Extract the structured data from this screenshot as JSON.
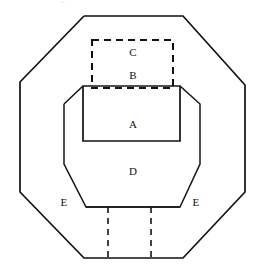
{
  "figure": {
    "background_color": "#ffffff",
    "line_color": "#111111",
    "canvas": {
      "width": 262,
      "height": 280
    },
    "artifact_top": "~",
    "labels": [
      {
        "id": "label-c",
        "text": "C",
        "x": 133,
        "y": 53
      },
      {
        "id": "label-b",
        "text": "B",
        "x": 133,
        "y": 76
      },
      {
        "id": "label-a",
        "text": "A",
        "x": 133,
        "y": 125
      },
      {
        "id": "label-d",
        "text": "D",
        "x": 133,
        "y": 172
      },
      {
        "id": "label-e-left",
        "text": "E",
        "x": 64,
        "y": 203
      },
      {
        "id": "label-e-right",
        "text": "E",
        "x": 196,
        "y": 203
      }
    ],
    "shapes": {
      "outer_octagon": {
        "name": "outer-octagon",
        "style": "solid",
        "points": "84,16 183,16 245,85 245,192 183,258 84,258 20,192 20,82 84,16"
      },
      "inner_octagon": {
        "name": "inner-octagon",
        "style": "solid",
        "points": "64,104 83,86 180,86 200,104 200,164 180,207 86,207 64,164 64,104"
      },
      "inner_notch": {
        "name": "inner-notch-region-a",
        "style": "solid",
        "points": "83,86 83,141 180,141 180,86"
      },
      "dashed_box_top": {
        "name": "dashed-box-bc",
        "style": "dashed",
        "x": 92,
        "y": 40,
        "width": 81,
        "height": 48
      },
      "bottom_channel_left": {
        "name": "bottom-channel-left-edge",
        "style": "dashed",
        "points": "108,207 108,258"
      },
      "bottom_channel_right": {
        "name": "bottom-channel-right-edge",
        "style": "dashed",
        "points": "151,207 151,258"
      },
      "bottom_channel_top": {
        "name": "bottom-channel-top-edge",
        "style": "solid",
        "points": "86,207 180,207"
      }
    }
  }
}
